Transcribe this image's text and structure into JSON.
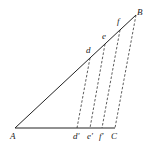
{
  "diagram": {
    "type": "geometry-projection",
    "points": {
      "A": {
        "label": "A",
        "x": 15,
        "y": 128
      },
      "B": {
        "label": "B",
        "x": 136,
        "y": 15
      },
      "C": {
        "label": "C",
        "x": 115,
        "y": 128
      },
      "d": {
        "label": "d",
        "x": 90,
        "y": 58
      },
      "e": {
        "label": "e",
        "x": 105,
        "y": 44
      },
      "f": {
        "label": "f",
        "x": 120,
        "y": 30
      },
      "d_prime": {
        "label": "d'",
        "x": 77,
        "y": 128
      },
      "e_prime": {
        "label": "e'",
        "x": 90,
        "y": 128
      },
      "f_prime": {
        "label": "f'",
        "x": 102,
        "y": 128
      }
    },
    "solid_segments": [
      [
        "A",
        "B"
      ],
      [
        "A",
        "C"
      ]
    ],
    "dashed_segments": [
      [
        "d",
        "d'"
      ],
      [
        "e",
        "e'"
      ],
      [
        "f",
        "f'"
      ],
      [
        "B",
        "C"
      ]
    ]
  },
  "labels": {
    "A": "A",
    "B": "B",
    "C": "C",
    "d": "d",
    "e": "e",
    "f": "f",
    "d_prime": "d'",
    "e_prime": "e'",
    "f_prime": "f'"
  }
}
